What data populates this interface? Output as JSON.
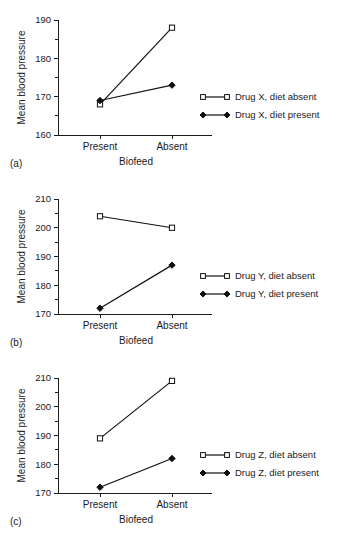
{
  "figure": {
    "panels": [
      {
        "tag": "(a)",
        "ylabel": "Mean blood pressure",
        "xlabel": "Biofeed",
        "categories": [
          "Present",
          "Absent"
        ],
        "y_ticks_major": [
          "160",
          "170",
          "180",
          "190"
        ],
        "legend": [
          {
            "label": "Drug X, diet absent",
            "marker": "open-square"
          },
          {
            "label": "Drug X, diet present",
            "marker": "filled-diamond"
          }
        ]
      },
      {
        "tag": "(b)",
        "ylabel": "Mean blood pressure",
        "xlabel": "Biofeed",
        "categories": [
          "Present",
          "Absent"
        ],
        "y_ticks_major": [
          "170",
          "180",
          "190",
          "200",
          "210"
        ],
        "legend": [
          {
            "label": "Drug Y, diet absent",
            "marker": "open-square"
          },
          {
            "label": "Drug Y, diet present",
            "marker": "filled-diamond"
          }
        ]
      },
      {
        "tag": "(c)",
        "ylabel": "Mean blood pressure",
        "xlabel": "Biofeed",
        "categories": [
          "Present",
          "Absent"
        ],
        "y_ticks_major": [
          "170",
          "180",
          "190",
          "200",
          "210"
        ],
        "legend": [
          {
            "label": "Drug Z, diet absent",
            "marker": "open-square"
          },
          {
            "label": "Drug Z, diet present",
            "marker": "filled-diamond"
          }
        ]
      }
    ]
  },
  "chart_data": [
    {
      "type": "line",
      "panel": "(a)",
      "title": "",
      "xlabel": "Biofeed",
      "ylabel": "Mean blood pressure",
      "categories": [
        "Present",
        "Absent"
      ],
      "ylim": [
        160,
        190
      ],
      "ytick_major": [
        160,
        170,
        180,
        190
      ],
      "ytick_minor": [
        165,
        175,
        185
      ],
      "grid": false,
      "legend_position": "right",
      "series": [
        {
          "name": "Drug X, diet absent",
          "marker": "open-square",
          "values": [
            168,
            188
          ]
        },
        {
          "name": "Drug X, diet present",
          "marker": "filled-diamond",
          "values": [
            169,
            173
          ]
        }
      ]
    },
    {
      "type": "line",
      "panel": "(b)",
      "title": "",
      "xlabel": "Biofeed",
      "ylabel": "Mean blood pressure",
      "categories": [
        "Present",
        "Absent"
      ],
      "ylim": [
        170,
        210
      ],
      "ytick_major": [
        170,
        180,
        190,
        200,
        210
      ],
      "ytick_minor": [
        175,
        185,
        195,
        205
      ],
      "grid": false,
      "legend_position": "right",
      "series": [
        {
          "name": "Drug Y, diet absent",
          "marker": "open-square",
          "values": [
            204,
            200
          ]
        },
        {
          "name": "Drug Y, diet present",
          "marker": "filled-diamond",
          "values": [
            172,
            187
          ]
        }
      ]
    },
    {
      "type": "line",
      "panel": "(c)",
      "title": "",
      "xlabel": "Biofeed",
      "ylabel": "Mean blood pressure",
      "categories": [
        "Present",
        "Absent"
      ],
      "ylim": [
        170,
        210
      ],
      "ytick_major": [
        170,
        180,
        190,
        200,
        210
      ],
      "ytick_minor": [
        175,
        185,
        195,
        205
      ],
      "grid": false,
      "legend_position": "right",
      "series": [
        {
          "name": "Drug Z, diet absent",
          "marker": "open-square",
          "values": [
            189,
            209
          ]
        },
        {
          "name": "Drug Z, diet present",
          "marker": "filled-diamond",
          "values": [
            172,
            182
          ]
        }
      ]
    }
  ]
}
